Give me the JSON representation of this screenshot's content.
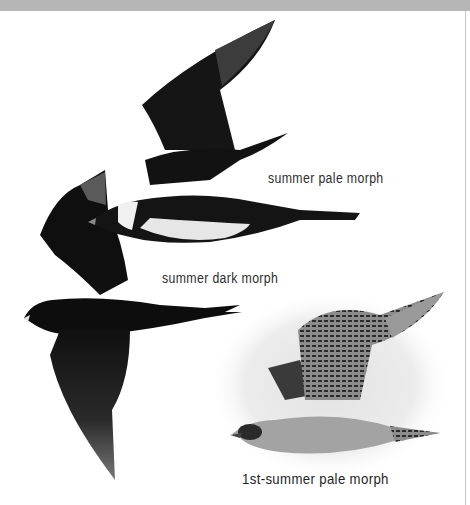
{
  "plate": {
    "header_bar_color": "#b6b6b6",
    "background_color": "#ffffff"
  },
  "figures": [
    {
      "id": "summer-pale",
      "label": "summer pale morph",
      "plumage_colors": {
        "upper": "#141414",
        "belly": "#e8e8e8",
        "collar": "#f2f2f2"
      }
    },
    {
      "id": "summer-dark",
      "label": "summer dark morph",
      "plumage_colors": {
        "body": "#0f0f0f",
        "wingtip": "#5a5a5a"
      }
    },
    {
      "id": "first-summer-pale",
      "label": "1st-summer pale morph",
      "plumage_colors": {
        "body": "#9a9a9a",
        "barring": "#2a2a2a",
        "halo": "#e4e4e4"
      }
    }
  ]
}
